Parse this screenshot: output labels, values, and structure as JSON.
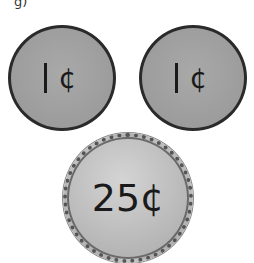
{
  "header": {
    "label_fragment": "g)"
  },
  "coins": [
    {
      "value_numeral": "",
      "symbol": "¢",
      "name": "penny",
      "display": "1¢"
    },
    {
      "value_numeral": "",
      "symbol": "¢",
      "name": "penny",
      "display": "1¢"
    },
    {
      "value_numeral": "25",
      "symbol": "¢",
      "name": "quarter",
      "display": "25¢"
    }
  ],
  "colors": {
    "penny_fill": "#9e9e9e",
    "penny_border": "#2a2a2a",
    "quarter_fill": "#bdbdbd",
    "text": "#1a1a1a"
  }
}
